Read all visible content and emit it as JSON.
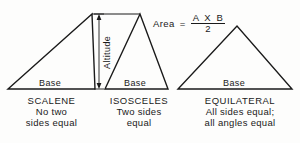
{
  "diagram": {
    "title_formula": {
      "area_word": "Area",
      "equals": "=",
      "numerator": "A X B",
      "denominator": "2"
    },
    "altitude_label": "Altitude",
    "triangles": [
      {
        "id": "scalene",
        "base_label": "Base",
        "name": "SCALENE",
        "description_line_1": "No two",
        "description_line_2": "sides equal"
      },
      {
        "id": "isosceles",
        "base_label": "Base",
        "name": "ISOSCELES",
        "description_line_1": "Two sides",
        "description_line_2": "equal"
      },
      {
        "id": "equilateral",
        "base_label": "Base",
        "name": "EQUILATERAL",
        "description_line_1": "All sides equal;",
        "description_line_2": "all angles equal"
      }
    ]
  },
  "colors": {
    "ink": "#1a1a1a",
    "paper": "#fdfdfc"
  }
}
